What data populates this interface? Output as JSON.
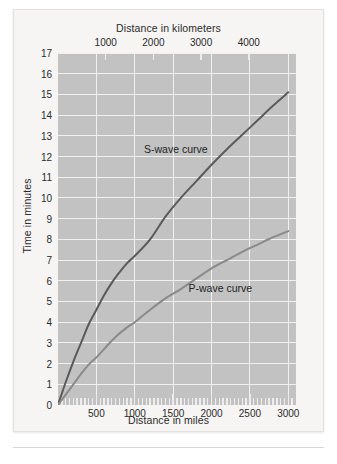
{
  "figure": {
    "top_axis_title": "Distance in kilometers",
    "bottom_axis_title": "Distance in miles",
    "y_axis_title": "Time in minutes"
  },
  "colors": {
    "plot_background": "#c2c2c2",
    "card_background": "#f6f5f3",
    "gridline": "#f0f0f0",
    "s_wave": "#5a5a5a",
    "p_wave": "#8a8a8a",
    "text": "#2b2b2b"
  },
  "chart_data": {
    "type": "line",
    "title": "",
    "xlabel": "Distance in miles",
    "ylabel": "Time in minutes",
    "x2label": "Distance in kilometers",
    "xlim": [
      0,
      3100
    ],
    "ylim": [
      0,
      17
    ],
    "x2lim": [
      0,
      4989
    ],
    "grid": true,
    "legend": "inline-annotations",
    "x_ticks": [
      500,
      1000,
      1500,
      2000,
      2500,
      3000
    ],
    "x_tick_labels": [
      "500",
      "1000",
      "1500",
      "2000",
      "2500",
      "3000"
    ],
    "x_minor_tick_step": 50,
    "x2_ticks": [
      1000,
      2000,
      3000,
      4000
    ],
    "x2_tick_labels": [
      "1000",
      "2000",
      "3000",
      "4000"
    ],
    "y_ticks": [
      0,
      1,
      2,
      3,
      4,
      5,
      6,
      7,
      8,
      9,
      10,
      11,
      12,
      13,
      14,
      15,
      16,
      17
    ],
    "y_tick_labels": [
      "0",
      "1",
      "2",
      "3",
      "4",
      "5",
      "6",
      "7",
      "8",
      "9",
      "10",
      "11",
      "12",
      "13",
      "14",
      "15",
      "16",
      "17"
    ],
    "series": [
      {
        "name": "S-wave curve",
        "label": "S-wave curve",
        "color": "#5a5a5a",
        "x": [
          0,
          100,
          200,
          300,
          400,
          500,
          600,
          700,
          800,
          900,
          1000,
          1200,
          1400,
          1600,
          1800,
          2000,
          2200,
          2400,
          2600,
          2800,
          3000
        ],
        "y": [
          0,
          1.1,
          2.1,
          3.0,
          3.9,
          4.6,
          5.3,
          5.9,
          6.4,
          6.85,
          7.2,
          8.0,
          9.1,
          10.0,
          10.8,
          11.6,
          12.35,
          13.05,
          13.75,
          14.45,
          15.1
        ]
      },
      {
        "name": "P-wave curve",
        "label": "P-wave curve",
        "color": "#8a8a8a",
        "x": [
          0,
          100,
          200,
          300,
          400,
          500,
          600,
          700,
          800,
          900,
          1000,
          1200,
          1400,
          1600,
          1800,
          2000,
          2200,
          2400,
          2600,
          2800,
          3000
        ],
        "y": [
          0,
          0.5,
          1.0,
          1.5,
          1.95,
          2.3,
          2.7,
          3.1,
          3.45,
          3.75,
          4.0,
          4.6,
          5.15,
          5.6,
          6.1,
          6.6,
          7.0,
          7.4,
          7.75,
          8.1,
          8.4
        ]
      }
    ],
    "annotations": [
      {
        "text": "S-wave curve",
        "x": 1120,
        "y": 12.3
      },
      {
        "text": "P-wave curve",
        "x": 1700,
        "y": 5.6
      }
    ]
  }
}
